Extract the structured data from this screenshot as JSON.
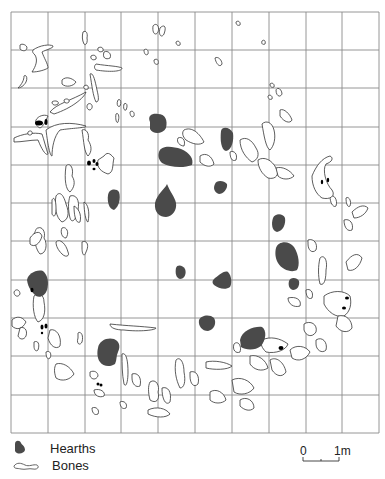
{
  "figure": {
    "type": "archaeological site plan",
    "grid": {
      "columns": 10,
      "rows": 11,
      "x_lines": [
        11,
        48,
        85,
        121,
        158,
        195,
        232,
        269,
        306,
        342,
        379
      ],
      "y_lines": [
        12,
        50,
        88,
        127,
        165,
        203,
        241,
        280,
        318,
        356,
        395,
        433
      ],
      "line_color": "#8a8a8a"
    },
    "colors": {
      "hearth_fill": "#4a4a4a",
      "bone_stroke": "#333333",
      "bone_fill": "#ffffff",
      "black_marks": "#000000"
    },
    "hearths": [
      {
        "id": "h1",
        "d": "M150,122 C147,115 153,113 158,114 C165,114 168,120 166,128 C163,134 153,135 150,129 Z"
      },
      {
        "id": "h2",
        "d": "M159,152 C161,145 172,146 181,149 C190,153 194,159 192,165 C185,168 170,168 162,163 C158,159 158,155 159,152 Z"
      },
      {
        "id": "h3",
        "d": "M221,131 C222,126 230,127 233,133 C234,140 232,150 226,151 C221,150 220,140 221,131 Z"
      },
      {
        "id": "h4",
        "d": "M215,184 C216,180 224,180 227,184 C228,189 223,194 219,194 C214,192 213,188 215,184 Z"
      },
      {
        "id": "h5",
        "d": "M108,195 C109,189 116,188 119,192 C121,198 119,207 114,210 C109,209 107,202 108,195 Z"
      },
      {
        "id": "h6",
        "d": "M167,184 C165,189 157,194 155,203 C154,213 160,217 166,217 C173,216 177,210 176,203 C175,197 170,192 167,184 Z"
      },
      {
        "id": "h7",
        "d": "M273,218 C275,213 283,213 285,218 C286,224 283,231 277,232 C272,231 271,224 273,218 Z"
      },
      {
        "id": "h8",
        "d": "M276,248 C278,241 289,240 294,247 C299,255 300,265 297,270 C292,273 282,270 278,263 C275,258 275,252 276,248 Z"
      },
      {
        "id": "h9",
        "d": "M289,281 C290,277 297,277 299,281 C300,286 297,290 293,290 C289,289 288,285 289,281 Z"
      },
      {
        "id": "h10",
        "d": "M176,268 C177,264 183,265 185,269 C187,274 184,279 180,279 C176,278 175,273 176,268 Z"
      },
      {
        "id": "h11",
        "d": "M214,279 C218,276 224,270 228,272 C232,276 232,284 230,287 C226,290 219,289 214,285 C212,283 212,281 214,279 Z"
      },
      {
        "id": "h12",
        "d": "M27,280 C28,274 36,269 43,271 C48,275 49,283 47,290 C45,296 40,298 36,296 C32,292 28,288 27,280 Z"
      },
      {
        "id": "h13",
        "d": "M199,320 C201,315 210,314 214,318 C217,323 214,330 208,331 C202,331 198,326 199,320 Z"
      },
      {
        "id": "h14",
        "d": "M240,340 C242,330 255,326 262,327 C267,330 266,340 261,346 C255,351 245,350 241,347 Z"
      },
      {
        "id": "h15",
        "d": "M98,348 C99,340 108,337 114,339 C119,341 121,346 118,352 C116,356 117,360 115,364 C111,367 103,367 100,362 C97,358 97,352 98,348 Z"
      }
    ],
    "black_marks": [
      {
        "id": "m1",
        "cx": 39,
        "cy": 123,
        "rx": 4,
        "ry": 2.5
      },
      {
        "id": "m2",
        "cx": 46,
        "cy": 122,
        "rx": 1.5,
        "ry": 3
      },
      {
        "id": "m3",
        "cx": 89,
        "cy": 163,
        "rx": 2,
        "ry": 2.5
      },
      {
        "id": "m4",
        "cx": 94,
        "cy": 161,
        "rx": 1.5,
        "ry": 2
      },
      {
        "id": "m5",
        "cx": 97,
        "cy": 164,
        "rx": 1.5,
        "ry": 2
      },
      {
        "id": "m6",
        "cx": 94,
        "cy": 169,
        "rx": 1.5,
        "ry": 1.2
      },
      {
        "id": "m7",
        "cx": 322,
        "cy": 182,
        "rx": 1.2,
        "ry": 2.2
      },
      {
        "id": "m8",
        "cx": 328,
        "cy": 180,
        "rx": 1.2,
        "ry": 2.2
      },
      {
        "id": "m9",
        "cx": 32,
        "cy": 290,
        "rx": 1.5,
        "ry": 2.2
      },
      {
        "id": "m10",
        "cx": 42,
        "cy": 327,
        "rx": 1.5,
        "ry": 2.5
      },
      {
        "id": "m11",
        "cx": 46,
        "cy": 326,
        "rx": 1.5,
        "ry": 2.5
      },
      {
        "id": "m12",
        "cx": 42,
        "cy": 333,
        "rx": 1.2,
        "ry": 1.2
      },
      {
        "id": "m13",
        "cx": 347,
        "cy": 298,
        "rx": 2,
        "ry": 1.5
      },
      {
        "id": "m14",
        "cx": 344,
        "cy": 308,
        "rx": 2,
        "ry": 1.5
      },
      {
        "id": "m15",
        "cx": 281,
        "cy": 348,
        "rx": 2.5,
        "ry": 2
      },
      {
        "id": "m16",
        "cx": 98,
        "cy": 384,
        "rx": 1.5,
        "ry": 1.5
      },
      {
        "id": "m17",
        "cx": 101,
        "cy": 385,
        "rx": 1.5,
        "ry": 1.5
      }
    ],
    "bones": [
      {
        "id": "b1",
        "d": "M20,45 C22,43 27,45 27,48 C26,52 22,51 20,49 Z"
      },
      {
        "id": "b2",
        "d": "M33,50 C40,45 50,44 53,46 C54,48 45,50 42,52 C44,58 48,64 48,68 C45,70 38,72 32,72 C36,66 38,60 35,55 C33,53 32,52 33,50 Z"
      },
      {
        "id": "b3",
        "d": "M24,76 C26,74 28,78 26,82 C24,86 20,88 18,88 C22,84 24,80 24,76 Z"
      },
      {
        "id": "b4",
        "d": "M83,32 C86,30 88,33 87,38 C88,42 86,46 84,44 C82,40 82,36 83,32 Z"
      },
      {
        "id": "b5",
        "d": "M98,48 C101,46 104,48 103,51 C100,53 97,51 98,48 Z"
      },
      {
        "id": "b6",
        "d": "M104,52 C108,50 112,54 110,58 C106,60 102,58 104,52 Z"
      },
      {
        "id": "b7",
        "d": "M91,56 C94,54 97,56 96,59 C93,61 90,59 91,56 Z"
      },
      {
        "id": "b8",
        "d": "M96,64 C108,66 118,66 122,68 C122,72 108,72 96,70 C94,68 94,66 96,64 Z"
      },
      {
        "id": "b9",
        "d": "M62,80 C66,76 72,78 76,82 C74,86 66,88 62,84 Z"
      },
      {
        "id": "b10",
        "d": "M90,74 C93,72 95,80 97,90 C99,98 99,102 96,102 C93,96 92,86 90,74 Z"
      },
      {
        "id": "b11",
        "d": "M84,86 C87,84 89,86 88,89 C85,90 83,88 84,86 Z"
      },
      {
        "id": "b12",
        "d": "M88,104 C92,102 94,108 90,110 C87,110 86,106 88,104 Z"
      },
      {
        "id": "b13",
        "d": "M50,112 C56,104 72,100 86,92 C84,98 72,108 54,114 Z"
      },
      {
        "id": "b14",
        "d": "M52,102 C54,100 60,101 58,104 C55,106 52,105 52,102 Z"
      },
      {
        "id": "b15",
        "d": "M64,100 C66,98 70,99 69,102 C67,104 64,103 64,100 Z"
      },
      {
        "id": "b16",
        "d": "M36,120 C38,116 44,114 48,116 C46,120 44,126 40,128 C36,126 35,123 36,120 Z"
      },
      {
        "id": "b17",
        "d": "M46,130 C56,122 72,122 86,126 C86,128 72,128 60,130 C54,136 52,148 52,156 C50,156 48,146 46,130 Z"
      },
      {
        "id": "b18",
        "d": "M14,138 C22,134 34,132 42,134 C44,140 46,148 48,154 C46,156 42,150 38,140 C30,140 22,142 14,142 Z"
      },
      {
        "id": "b19",
        "d": "M28,132 C30,130 33,131 32,134 C30,136 27,135 28,132 Z"
      },
      {
        "id": "b20",
        "d": "M82,130 C86,128 90,134 88,140 C92,146 92,152 88,156 C84,152 84,142 82,130 Z"
      },
      {
        "id": "b21",
        "d": "M104,156 C108,150 112,156 114,158 C112,166 114,172 108,174 C102,172 96,168 98,160 Z"
      },
      {
        "id": "b22",
        "d": "M66,166 C70,162 74,168 72,176 C76,182 74,188 70,192 C66,190 64,180 66,166 Z"
      },
      {
        "id": "b23",
        "d": "M56,196 C60,190 64,196 66,204 C70,214 68,220 62,222 C56,218 54,206 56,196 Z"
      },
      {
        "id": "b24",
        "d": "M70,196 C76,194 80,200 78,210 C76,220 72,224 70,218 C68,210 68,202 70,196 Z"
      },
      {
        "id": "b25",
        "d": "M52,200 C54,196 56,200 56,208 C56,216 54,218 52,214 Z"
      },
      {
        "id": "b26",
        "d": "M74,206 C78,208 82,214 80,222 C76,224 74,216 74,206 Z"
      },
      {
        "id": "b27",
        "d": "M84,202 C88,204 90,212 88,222 C86,222 84,212 84,202 Z"
      },
      {
        "id": "b28",
        "d": "M38,228 C42,226 46,232 44,238 C48,244 46,254 40,254 C36,250 34,240 34,234 C36,230 36,228 38,228 Z"
      },
      {
        "id": "b29",
        "d": "M30,238 C34,232 40,230 42,236 C40,244 34,248 30,244 Z"
      },
      {
        "id": "b30",
        "d": "M56,242 C60,238 66,244 68,252 C70,256 66,258 62,254 C58,250 56,246 56,242 Z"
      },
      {
        "id": "b31",
        "d": "M62,228 C66,226 70,232 66,238 C62,238 60,232 62,228 Z"
      },
      {
        "id": "b32",
        "d": "M82,242 C86,240 90,244 86,252 C84,258 82,254 82,248 Z"
      },
      {
        "id": "b33",
        "d": "M14,292 C16,288 20,290 20,294 C18,298 14,296 14,292 Z"
      },
      {
        "id": "b34",
        "d": "M34,296 C38,292 44,294 44,302 C46,312 44,320 38,322 C34,318 32,306 34,296 Z"
      },
      {
        "id": "b35",
        "d": "M12,320 C16,316 22,316 26,322 C22,330 16,330 12,326 Z"
      },
      {
        "id": "b36",
        "d": "M20,328 C24,326 28,330 26,336 C24,340 20,340 18,336 Z"
      },
      {
        "id": "b37",
        "d": "M50,330 C56,328 62,336 60,346 C56,350 50,346 48,338 Z"
      },
      {
        "id": "b38",
        "d": "M34,342 C38,340 40,344 38,350 C36,352 34,350 34,346 Z"
      },
      {
        "id": "b39",
        "d": "M46,352 C50,350 52,354 50,358 C48,360 46,358 46,352 Z"
      },
      {
        "id": "b40",
        "d": "M56,364 C62,362 70,366 74,374 C70,380 62,382 56,378 C54,372 54,368 56,364 Z"
      },
      {
        "id": "b41",
        "d": "M78,333 C80,331 84,334 82,342 C80,346 76,344 78,338 Z"
      },
      {
        "id": "b42",
        "d": "M110,324 C128,326 140,326 156,328 C156,330 140,332 124,330 C116,330 110,328 110,324 Z"
      },
      {
        "id": "b43",
        "d": "M122,354 C126,352 128,360 128,372 C128,382 126,388 124,384 C122,374 122,364 122,354 Z"
      },
      {
        "id": "b44",
        "d": "M90,372 C94,370 98,372 98,376 C96,380 92,380 90,376 Z"
      },
      {
        "id": "b45",
        "d": "M94,390 C100,388 106,392 104,396 C100,398 94,396 94,390 Z"
      },
      {
        "id": "b46",
        "d": "M92,408 C96,406 100,410 98,414 C94,416 92,412 92,408 Z"
      },
      {
        "id": "b47",
        "d": "M120,402 C124,400 128,404 126,408 C122,410 120,406 120,402 Z"
      },
      {
        "id": "b48",
        "d": "M150,382 C156,378 160,386 158,392 C160,400 156,404 150,400 C148,392 148,386 150,382 Z"
      },
      {
        "id": "b49",
        "d": "M162,388 C168,386 172,392 170,402 C166,406 162,400 162,388 Z"
      },
      {
        "id": "b50",
        "d": "M148,410 C156,406 166,408 170,414 C166,418 156,418 148,414 Z"
      },
      {
        "id": "b51",
        "d": "M176,360 C180,356 184,362 184,372 C186,382 184,388 180,388 C176,380 174,370 176,360 Z"
      },
      {
        "id": "b52",
        "d": "M206,362 C214,360 226,362 232,366 C228,370 214,370 206,368 Z"
      },
      {
        "id": "b53",
        "d": "M210,392 C216,388 224,392 226,400 C222,404 214,404 210,400 Z"
      },
      {
        "id": "b54",
        "d": "M232,380 C240,376 250,380 254,388 C250,394 240,396 234,392 Z"
      },
      {
        "id": "b55",
        "d": "M240,400 C246,396 254,400 254,408 C250,412 244,410 240,406 Z"
      },
      {
        "id": "b56",
        "d": "M250,356 C258,354 266,360 268,368 C262,372 254,370 250,364 Z"
      },
      {
        "id": "b57",
        "d": "M262,340 C270,336 280,338 288,344 C286,350 276,354 266,352 C262,348 260,344 262,340 Z"
      },
      {
        "id": "b58",
        "d": "M270,360 C276,356 284,362 286,372 C282,378 276,376 272,370 Z"
      },
      {
        "id": "b59",
        "d": "M290,350 C296,344 306,346 310,352 C306,360 298,362 292,358 Z"
      },
      {
        "id": "b60",
        "d": "M304,324 C310,320 318,324 316,332 C312,338 306,336 304,330 Z"
      },
      {
        "id": "b61",
        "d": "M316,340 C322,336 328,342 326,350 C322,354 316,350 316,344 Z"
      },
      {
        "id": "b62",
        "d": "M324,296 C332,290 344,290 350,296 C352,304 350,312 344,316 C336,318 328,312 324,304 Z"
      },
      {
        "id": "b63",
        "d": "M320,258 C324,254 328,260 326,270 C326,280 324,286 320,284 C318,276 318,266 320,258 Z"
      },
      {
        "id": "b64",
        "d": "M338,316 C346,314 352,320 352,328 C348,334 340,332 336,326 Z"
      },
      {
        "id": "b65",
        "d": "M306,290 C310,288 314,292 312,298 C308,300 306,296 306,290 Z"
      },
      {
        "id": "b66",
        "d": "M288,298 C296,296 302,300 300,306 C294,308 288,304 288,298 Z"
      },
      {
        "id": "b67",
        "d": "M346,262 C352,254 358,252 362,258 C360,266 354,272 348,270 Z"
      },
      {
        "id": "b68",
        "d": "M344,220 C350,218 354,224 352,230 C348,232 344,228 344,220 Z"
      },
      {
        "id": "b69",
        "d": "M352,212 C358,206 364,204 368,208 C366,214 360,218 354,218 Z"
      },
      {
        "id": "b70",
        "d": "M346,198 C348,196 352,200 350,206 C348,208 346,204 346,198 Z"
      },
      {
        "id": "b71",
        "d": "M330,196 C334,194 338,200 336,206 C334,208 330,204 330,196 Z"
      },
      {
        "id": "b72",
        "d": "M308,240 C314,238 318,244 316,250 C312,254 308,250 308,244 Z"
      },
      {
        "id": "b73",
        "d": "M312,176 C316,166 322,158 330,156 C334,158 332,162 326,164 C322,170 326,184 332,190 C336,196 330,200 322,198 C316,194 312,186 312,176 Z"
      },
      {
        "id": "b74",
        "d": "M262,124 C266,120 272,122 274,130 C276,138 274,146 270,150 C266,148 264,136 262,124 Z"
      },
      {
        "id": "b75",
        "d": "M280,110 C284,108 290,114 292,120 C290,124 284,122 280,116 Z"
      },
      {
        "id": "b76",
        "d": "M240,140 C246,136 252,140 256,148 C260,154 258,160 252,162 C246,158 240,150 240,140 Z"
      },
      {
        "id": "b77",
        "d": "M258,160 C264,156 272,160 276,168 C280,174 276,180 268,178 C262,174 258,168 258,160 Z"
      },
      {
        "id": "b78",
        "d": "M276,168 C282,166 290,170 294,176 C290,180 282,180 278,176 Z"
      },
      {
        "id": "b79",
        "d": "M230,152 C234,150 238,154 236,160 C232,162 230,158 230,152 Z"
      },
      {
        "id": "b80",
        "d": "M276,90 C278,86 282,90 282,94 C280,98 276,96 276,90 Z"
      },
      {
        "id": "b81",
        "d": "M270,84 C272,82 275,84 274,87 C272,88 270,87 270,84 Z"
      },
      {
        "id": "b82",
        "d": "M268,96 C270,94 273,96 272,99 C270,100 268,99 268,96 Z"
      },
      {
        "id": "b83",
        "d": "M153,26 C156,22 160,26 158,32 C156,36 152,34 153,26 Z"
      },
      {
        "id": "b84",
        "d": "M160,28 C164,24 167,26 164,34 C162,38 158,36 160,28 Z"
      },
      {
        "id": "b85",
        "d": "M176,42 C178,40 181,42 180,45 C178,46 176,45 176,42 Z"
      },
      {
        "id": "b86",
        "d": "M236,22 C238,20 241,22 240,25 C238,26 236,25 236,22 Z"
      },
      {
        "id": "b87",
        "d": "M262,41 C264,39 266,41 265,44 C263,45 261,44 262,41 Z"
      },
      {
        "id": "b88",
        "d": "M215,58 C218,56 222,60 222,64 C220,68 216,64 215,58 Z"
      },
      {
        "id": "b89",
        "d": "M144,50 C146,48 149,50 148,54 C146,56 144,54 144,50 Z"
      },
      {
        "id": "b90",
        "d": "M154,60 C157,58 159,60 158,64 C156,65 154,64 154,60 Z"
      },
      {
        "id": "b91",
        "d": "M118,100 C120,98 122,102 120,106 C118,108 116,104 118,100 Z"
      },
      {
        "id": "b92",
        "d": "M124,104 C127,102 128,106 126,110 C124,111 123,108 124,104 Z"
      },
      {
        "id": "b93",
        "d": "M130,112 C132,110 135,112 134,116 C132,118 130,116 130,112 Z"
      },
      {
        "id": "b94",
        "d": "M116,114 C118,112 120,116 118,122 C117,124 115,120 116,114 Z"
      },
      {
        "id": "b95",
        "d": "M184,130 C192,126 200,134 204,142 C200,146 192,144 186,140 C182,136 182,132 184,130 Z"
      },
      {
        "id": "b96",
        "d": "M178,138 C182,136 186,140 184,146 C180,146 176,142 178,138 Z"
      },
      {
        "id": "b97",
        "d": "M200,156 C206,152 212,156 214,164 C210,168 204,166 200,162 Z"
      },
      {
        "id": "b98",
        "d": "M234,344 C238,340 242,346 240,352 C236,354 232,350 234,344 Z"
      },
      {
        "id": "b99",
        "d": "M190,372 C196,370 200,376 198,384 C194,388 190,384 190,376 Z"
      },
      {
        "id": "b100",
        "d": "M132,374 C138,372 142,378 140,386 C136,388 132,384 132,378 Z"
      }
    ]
  },
  "legend": {
    "hearths_label": "Hearths",
    "bones_label": "Bones"
  },
  "scale_bar": {
    "start_label": "0",
    "end_label": "1m"
  }
}
